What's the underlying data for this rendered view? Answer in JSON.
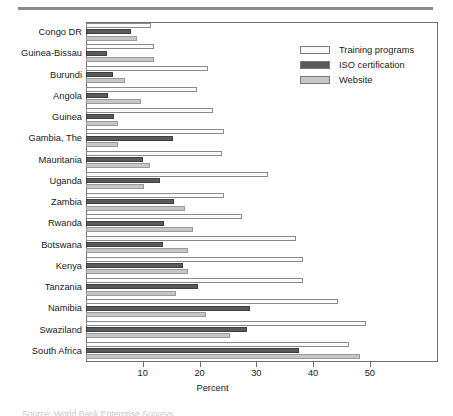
{
  "figure": {
    "x_axis_title": "Percent",
    "bottom_caption": "Source: World Bank Enterprise Surveys."
  },
  "legend": {
    "position": "top-right",
    "entries": [
      {
        "label": "Training programs",
        "color": "#fbfbfb",
        "key": "training_programs"
      },
      {
        "label": "ISO certification",
        "color": "#5a5a5a",
        "key": "iso_certification"
      },
      {
        "label": "Website",
        "color": "#c6c6c6",
        "key": "website"
      }
    ]
  },
  "chart_data": {
    "type": "bar",
    "orientation": "horizontal",
    "title": "",
    "subtitle": "",
    "xlabel": "Percent",
    "ylabel": "",
    "xlim": [
      0,
      62
    ],
    "grid": false,
    "legend_position": "top-right",
    "xticks": [
      10,
      20,
      30,
      40,
      50
    ],
    "xtick_labels": [
      "10",
      "20",
      "30",
      "40",
      "50"
    ],
    "categories": [
      "Congo DR",
      "Guinea-Bissau",
      "Burundi",
      "Angola",
      "Guinea",
      "Gambia, The",
      "Mauritania",
      "Uganda",
      "Zambia",
      "Rwanda",
      "Botswana",
      "Kenya",
      "Tanzania",
      "Namibia",
      "Swaziland",
      "South Africa"
    ],
    "series": [
      {
        "name": "Training programs",
        "color": "#fbfbfb",
        "values": [
          11.5,
          12.0,
          21.5,
          19.5,
          22.3,
          24.3,
          24.0,
          32.0,
          24.3,
          27.5,
          37.0,
          38.3,
          38.2,
          44.3,
          49.3,
          46.3
        ]
      },
      {
        "name": "ISO certification",
        "color": "#5a5a5a",
        "values": [
          8.0,
          3.7,
          4.8,
          3.9,
          5.0,
          15.3,
          10.0,
          13.0,
          15.5,
          13.7,
          13.5,
          17.0,
          19.8,
          28.8,
          28.3,
          37.5
        ]
      },
      {
        "name": "Website",
        "color": "#c6c6c6",
        "values": [
          9.0,
          12.0,
          6.8,
          9.7,
          5.7,
          5.7,
          11.3,
          10.3,
          17.5,
          18.8,
          18.0,
          18.0,
          15.8,
          21.2,
          25.3,
          48.2
        ]
      }
    ]
  }
}
